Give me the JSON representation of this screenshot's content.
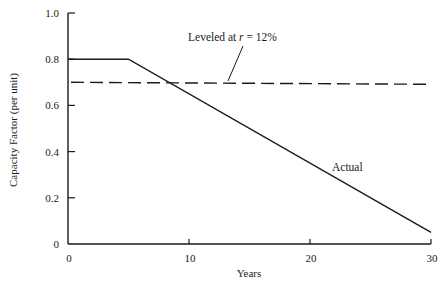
{
  "chart_data": {
    "type": "line",
    "title": "",
    "xlabel": "Years",
    "ylabel": "Capacity Factor (per unit)",
    "xlim": [
      0,
      30
    ],
    "ylim": [
      0,
      1.0
    ],
    "x_ticks": [
      "0",
      "10",
      "20",
      "30"
    ],
    "y_ticks": [
      "0",
      "0.2",
      "0.4",
      "0.6",
      "0.8",
      "1.0"
    ],
    "grid": false,
    "legend": null,
    "series": [
      {
        "name": "Actual",
        "style": "solid",
        "x": [
          0,
          5,
          30
        ],
        "y": [
          0.8,
          0.8,
          0.05
        ]
      },
      {
        "name": "Leveled at r = 12%",
        "style": "dashed",
        "x": [
          0,
          30
        ],
        "y": [
          0.7,
          0.7
        ]
      }
    ],
    "annotations": [
      {
        "text": "Leveled at r = 12%",
        "points_to": "dashed line near x≈14"
      },
      {
        "text": "Actual",
        "position": "beside declining line near x≈21"
      }
    ]
  },
  "labels": {
    "xlabel": "Years",
    "ylabel": "Capacity Factor (per unit)",
    "leveled_prefix": "Leveled at ",
    "leveled_var": "r",
    "leveled_suffix": " = 12%",
    "actual": "Actual"
  }
}
